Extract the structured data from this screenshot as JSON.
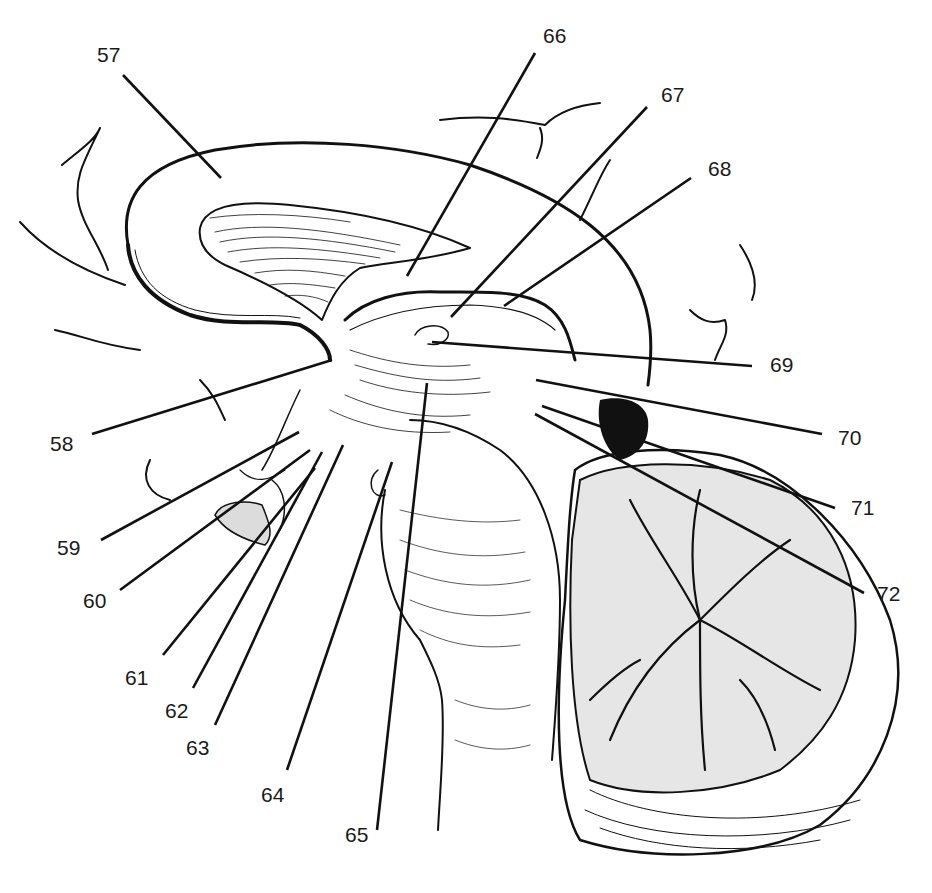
{
  "figure": {
    "background": "#ffffff",
    "ink": "#111111"
  },
  "labels": [
    {
      "id": "57",
      "text": "57",
      "x": 97,
      "y": 44,
      "line": [
        123,
        75,
        221,
        178
      ]
    },
    {
      "id": "58",
      "text": "58",
      "x": 50,
      "y": 433,
      "line": [
        92,
        434,
        332,
        360
      ]
    },
    {
      "id": "59",
      "text": "59",
      "x": 57,
      "y": 537,
      "line": [
        101,
        540,
        299,
        432
      ]
    },
    {
      "id": "60",
      "text": "60",
      "x": 83,
      "y": 590,
      "line": [
        120,
        590,
        310,
        450
      ]
    },
    {
      "id": "61",
      "text": "61",
      "x": 125,
      "y": 667,
      "line": [
        163,
        655,
        315,
        468
      ]
    },
    {
      "id": "62",
      "text": "62",
      "x": 165,
      "y": 700,
      "line": [
        193,
        688,
        322,
        452
      ]
    },
    {
      "id": "63",
      "text": "63",
      "x": 186,
      "y": 737,
      "line": [
        215,
        725,
        343,
        445
      ]
    },
    {
      "id": "64",
      "text": "64",
      "x": 261,
      "y": 784,
      "line": [
        287,
        770,
        392,
        462
      ]
    },
    {
      "id": "65",
      "text": "65",
      "x": 345,
      "y": 824,
      "line": [
        377,
        830,
        427,
        383
      ]
    },
    {
      "id": "66",
      "text": "66",
      "x": 543,
      "y": 25,
      "line": [
        535,
        53,
        407,
        276
      ]
    },
    {
      "id": "67",
      "text": "67",
      "x": 661,
      "y": 84,
      "line": [
        647,
        107,
        451,
        317
      ]
    },
    {
      "id": "68",
      "text": "68",
      "x": 708,
      "y": 158,
      "line": [
        691,
        178,
        504,
        306
      ]
    },
    {
      "id": "69",
      "text": "69",
      "x": 770,
      "y": 354,
      "line": [
        752,
        366,
        432,
        342
      ]
    },
    {
      "id": "70",
      "text": "70",
      "x": 838,
      "y": 427,
      "line": [
        822,
        434,
        536,
        380
      ]
    },
    {
      "id": "71",
      "text": "71",
      "x": 851,
      "y": 497,
      "line": [
        835,
        508,
        542,
        406
      ]
    },
    {
      "id": "72",
      "text": "72",
      "x": 877,
      "y": 583,
      "line": [
        864,
        593,
        535,
        414
      ]
    }
  ]
}
